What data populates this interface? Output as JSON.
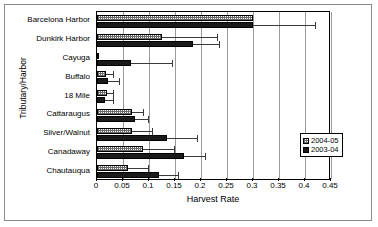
{
  "chart_data": {
    "type": "bar",
    "orientation": "horizontal",
    "title": "",
    "xlabel": "Harvest Rate",
    "ylabel": "Tributary/Harbor",
    "xlim": [
      0,
      0.45
    ],
    "xticks": [
      "0",
      "0.05",
      "0.1",
      "0.15",
      "0.2",
      "0.25",
      "0.3",
      "0.35",
      "0.4",
      "0.45"
    ],
    "xtick_values": [
      0,
      0.05,
      0.1,
      0.15,
      0.2,
      0.25,
      0.3,
      0.35,
      0.4,
      0.45
    ],
    "grid": true,
    "legend_position": "right-lower",
    "categories": [
      "Barcelona Harbor",
      "Dunkirk Harbor",
      "Cayuga",
      "Buffalo",
      "18 Mile",
      "Cattaraugus",
      "Silver/Walnut",
      "Canadaway",
      "Chautauqua"
    ],
    "series": [
      {
        "name": "2004-05",
        "style": "hatched-light",
        "values": [
          0.3,
          0.125,
          0.003,
          0.018,
          0.02,
          0.067,
          0.067,
          0.088,
          0.06
        ],
        "error_upper": [
          0.3,
          0.23,
          0.003,
          0.03,
          0.03,
          0.088,
          0.105,
          0.148,
          0.098
        ]
      },
      {
        "name": "2003-04",
        "style": "solid-black",
        "values": [
          0.3,
          0.185,
          0.065,
          0.022,
          0.015,
          0.073,
          0.135,
          0.168,
          0.12
        ],
        "error_upper": [
          0.42,
          0.235,
          0.145,
          0.042,
          0.03,
          0.098,
          0.192,
          0.208,
          0.155
        ]
      }
    ]
  },
  "legend": {
    "items": [
      {
        "label": "2004-05",
        "swatch": "light-hatched"
      },
      {
        "label": "2003-04",
        "swatch": "solid-black"
      }
    ]
  },
  "axis": {
    "x_title": "Harvest Rate",
    "y_title": "Tributary/Harbor"
  },
  "colors": {
    "series_2004_05": "#ffffff",
    "series_2003_04": "#1a1a1a",
    "gridline": "#9a9a9a",
    "axis": "#000000",
    "background": "#ffffff"
  }
}
